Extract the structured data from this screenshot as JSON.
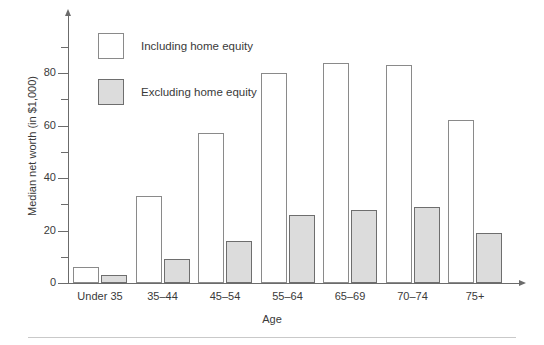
{
  "chart_data": {
    "type": "bar",
    "title": "",
    "xlabel": "Age",
    "ylabel": "Median net worth (in $1,000)",
    "categories": [
      "Under 35",
      "35–44",
      "45–54",
      "55–64",
      "65–69",
      "70–74",
      "75+"
    ],
    "series": [
      {
        "name": "Including home equity",
        "values": [
          6,
          33,
          57,
          80,
          84,
          83,
          62
        ],
        "color": "#ffffff",
        "edge_color": "#8a8a8a"
      },
      {
        "name": "Excluding home equity",
        "values": [
          3,
          9,
          16,
          26,
          28,
          29,
          19
        ],
        "color": "#dcdcdc",
        "edge_color": "#6e6e6e"
      }
    ],
    "ylim": [
      0,
      95
    ],
    "y_major_ticks": [
      0,
      20,
      40,
      60,
      80
    ],
    "y_major_tick_labels": [
      "0",
      "20",
      "40",
      "60",
      "80"
    ],
    "y_minor_ticks": [
      10,
      30,
      50,
      70,
      90
    ],
    "grid": false,
    "legend_position": "upper-left-inside"
  },
  "axes": {
    "y_title": "Median net worth (in $1,000)",
    "x_title": "Age"
  },
  "legend": {
    "items": [
      {
        "label": "Including home equity",
        "swatch": "white-square"
      },
      {
        "label": "Excluding home equity",
        "swatch": "grey-square"
      }
    ]
  },
  "colors": {
    "axis": "#6b6b6b",
    "text": "#3a3a3a",
    "including_fill": "#ffffff",
    "including_edge": "#8a8a8a",
    "excluding_fill": "#dcdcdc",
    "excluding_edge": "#6e6e6e",
    "footer_rule": "#c9c9c9"
  }
}
